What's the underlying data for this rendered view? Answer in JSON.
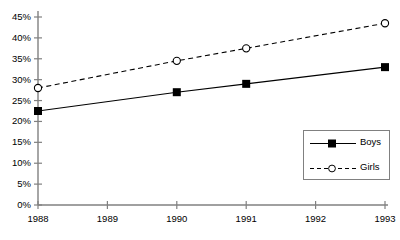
{
  "chart_data": {
    "type": "line",
    "title": "",
    "subtitle": "",
    "xlabel": "",
    "ylabel": "",
    "x": [
      1988,
      1989,
      1990,
      1991,
      1992,
      1993
    ],
    "categories": [
      "1988",
      "1989",
      "1990",
      "1991",
      "1992",
      "1993"
    ],
    "xlim": [
      1988,
      1993
    ],
    "ylim": [
      0,
      45
    ],
    "y_ticks": [
      0,
      5,
      10,
      15,
      20,
      25,
      30,
      35,
      40,
      45
    ],
    "y_tick_labels": [
      "0%",
      "5%",
      "10%",
      "15%",
      "20%",
      "25%",
      "30%",
      "35%",
      "40%",
      "45%"
    ],
    "x_tick_labels": [
      "1988",
      "1989",
      "1990",
      "1991",
      "1992",
      "1993"
    ],
    "grid": false,
    "legend_position": "lower-right",
    "series": [
      {
        "name": "Boys",
        "line_style": "solid",
        "marker": "filled-square",
        "color": "#000000",
        "x": [
          1988,
          1990,
          1991,
          1993
        ],
        "values": [
          22.5,
          27.0,
          29.0,
          33.0
        ]
      },
      {
        "name": "Girls",
        "line_style": "dashed",
        "marker": "open-circle",
        "color": "#000000",
        "x": [
          1988,
          1990,
          1991,
          1993
        ],
        "values": [
          28.0,
          34.5,
          37.5,
          43.5
        ]
      }
    ]
  },
  "legend": {
    "items": [
      {
        "label": "Boys"
      },
      {
        "label": "Girls"
      }
    ]
  },
  "axes": {
    "axis_color": "#808080",
    "tick_color": "#808080"
  }
}
